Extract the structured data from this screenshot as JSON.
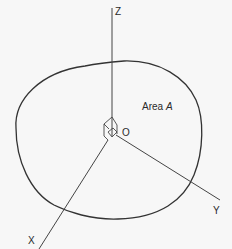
{
  "diagram": {
    "type": "3d-coordinate-axes-with-planar-area",
    "axes": {
      "z": {
        "label": "Z"
      },
      "x": {
        "label": "X"
      },
      "y": {
        "label": "Y"
      }
    },
    "origin": {
      "label": "O"
    },
    "area": {
      "prefix": "Area ",
      "symbol": "A"
    },
    "colors": {
      "background": "#f7f7f7",
      "line": "#333333",
      "text": "#2a2a2a"
    }
  }
}
